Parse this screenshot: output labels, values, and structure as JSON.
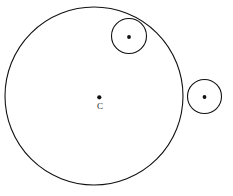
{
  "figure": {
    "background_color": "#ffffff",
    "stroke_color": "#111111",
    "label_color": "#1a1a1a",
    "canvas": {
      "width": 233,
      "height": 196
    }
  },
  "chart_data": {
    "type": "diagram",
    "xlabel": "",
    "ylabel": "",
    "grid": false,
    "legend": null,
    "coordinate_system": "pixel, origin top-left",
    "xlim": [
      0,
      233
    ],
    "ylim": [
      0,
      196
    ],
    "shapes": [
      {
        "name": "main-circle",
        "type": "circle",
        "cx": 94,
        "cy": 96,
        "r": 89,
        "stroke": "#111111",
        "stroke_width": 1.1,
        "fill": "none",
        "center_marker": true,
        "center_label": "C"
      },
      {
        "name": "small-circle-top",
        "type": "circle",
        "cx": 129,
        "cy": 36,
        "r": 17.5,
        "stroke": "#111111",
        "stroke_width": 1.1,
        "fill": "none",
        "center_marker": true,
        "center_label": "",
        "tangency": "internal"
      },
      {
        "name": "small-circle-right",
        "type": "circle",
        "cx": 204.5,
        "cy": 96.5,
        "r": 17,
        "stroke": "#111111",
        "stroke_width": 1.1,
        "fill": "none",
        "center_marker": true,
        "center_label": "",
        "tangency": "external"
      }
    ],
    "points": [
      {
        "name": "main-center",
        "x": 99.3,
        "y": 97.3,
        "r": 2.1,
        "label": "C",
        "label_x": 100,
        "label_y": 109
      },
      {
        "name": "top-circle-center",
        "x": 129,
        "y": 37,
        "r": 1.9,
        "label": "",
        "label_x": 129,
        "label_y": 37
      },
      {
        "name": "right-circle-center",
        "x": 204.5,
        "y": 97,
        "r": 1.9,
        "label": "",
        "label_x": 204.5,
        "label_y": 97
      }
    ]
  },
  "labels": {
    "center_label": "C"
  }
}
